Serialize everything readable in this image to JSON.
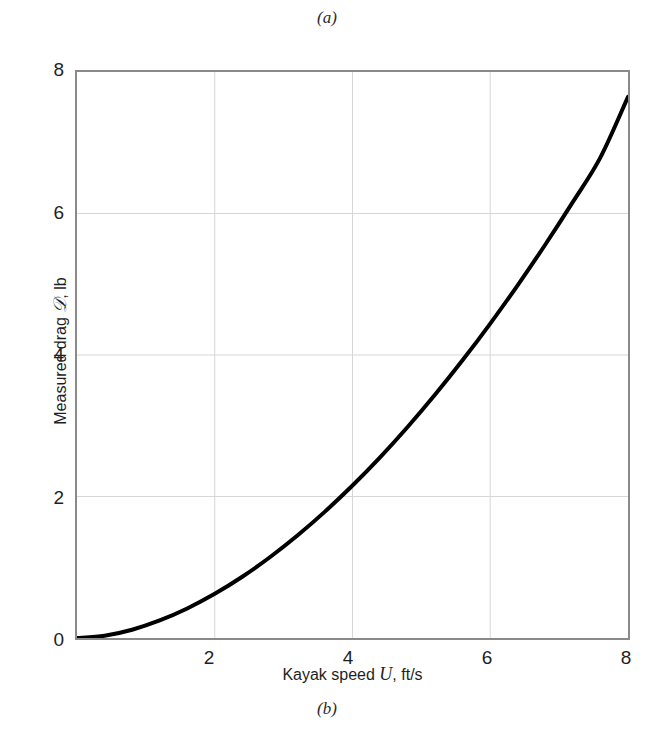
{
  "figure": {
    "caption_top": "(a)",
    "caption_bottom": "(b)"
  },
  "chart_data": {
    "type": "line",
    "title": "",
    "subtitle": "",
    "xlabel_full": "Kayak speed U, ft/s",
    "xlabel_prefix": "Kayak speed",
    "xlabel_symbol": "U",
    "xlabel_suffix": ", ft/s",
    "ylabel_full": "Measured drag 𝒟, lb",
    "ylabel_prefix": "Measured drag",
    "ylabel_symbol": "𝒟",
    "ylabel_suffix": ", lb",
    "xlim": [
      0,
      8
    ],
    "ylim": [
      0,
      8
    ],
    "xticks": [
      0,
      2,
      4,
      6,
      8
    ],
    "yticks": [
      0,
      2,
      4,
      6,
      8
    ],
    "xtick_labels": [
      "",
      "2",
      "4",
      "6",
      "8"
    ],
    "ytick_labels": [
      "0",
      "2",
      "4",
      "6",
      "8"
    ],
    "grid": true,
    "grid_color": "#d6d6d6",
    "frame_color": "#8a8a8a",
    "legend": null,
    "series": [
      {
        "name": "Measured drag",
        "color": "#000000",
        "line_width": 4,
        "x": [
          0.0,
          0.4,
          0.8,
          1.2,
          1.6,
          2.0,
          2.4,
          2.8,
          3.2,
          3.6,
          4.0,
          4.4,
          4.8,
          5.2,
          5.6,
          6.0,
          6.4,
          6.8,
          7.2,
          7.6,
          8.0
        ],
        "y": [
          0.0,
          0.032,
          0.117,
          0.248,
          0.418,
          0.625,
          0.866,
          1.141,
          1.448,
          1.786,
          2.155,
          2.554,
          2.983,
          3.441,
          3.928,
          4.444,
          4.989,
          5.562,
          6.164,
          6.794,
          7.65
        ]
      }
    ],
    "annotations": []
  }
}
